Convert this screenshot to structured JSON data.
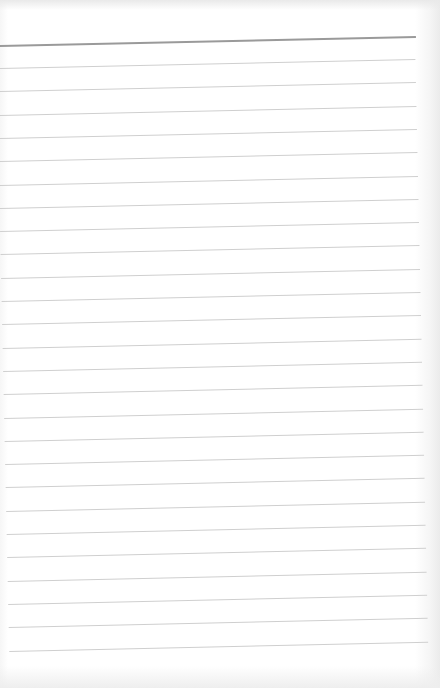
{
  "page": {
    "type": "lined paper",
    "content_text": "",
    "header_line": {
      "y": 45,
      "color": "#9a9a9a",
      "thickness": 2
    },
    "ruled_lines": {
      "count": 26,
      "first_y": 68,
      "spacing": 23.3,
      "color": "#cfcfcf",
      "right_end_x": 415
    },
    "tilt_degrees": -1.25,
    "background_color": "#ffffff"
  }
}
